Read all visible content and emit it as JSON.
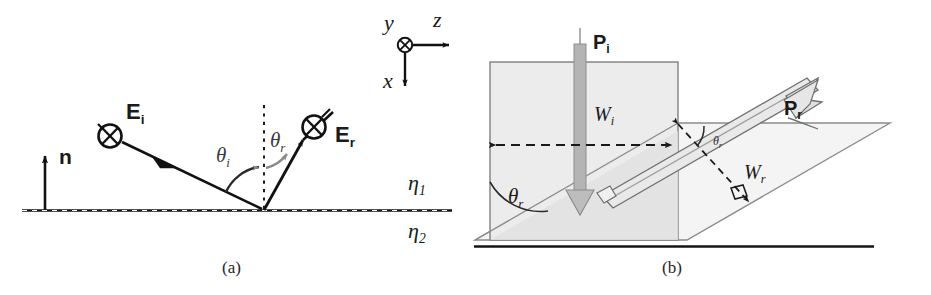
{
  "figure": {
    "width": 931,
    "height": 295,
    "background": "#ffffff"
  },
  "colors": {
    "line": "#111111",
    "beam_fill": "#ececec",
    "beam_fill_dark": "#dddddd",
    "beam_outline": "#8c8c8c",
    "arrow_gray": "#a8a8a8",
    "interface_dash": "#2a2a2a",
    "text": "#1a1a1a"
  },
  "panel_a": {
    "caption": "(a)",
    "axes": {
      "y_label": "y",
      "z_label": "z",
      "x_label": "x",
      "origin_marker": "circle-x-marker"
    },
    "normal": {
      "label": "n",
      "description": "surface normal unit vector"
    },
    "incident": {
      "field_label": "E",
      "field_sub": "i",
      "angle_label": "θ",
      "angle_sub": "i",
      "polarization_marker": "circle-x-marker"
    },
    "reflected": {
      "field_label": "E",
      "field_sub": "r",
      "angle_label": "θ",
      "angle_sub": "r",
      "polarization_marker": "circle-x-marker"
    },
    "media": {
      "upper_label": "η",
      "upper_sub": "1",
      "lower_label": "η",
      "lower_sub": "2"
    }
  },
  "panel_b": {
    "caption": "(b)",
    "incident_beam": {
      "power_label": "P",
      "power_sub": "i",
      "width_label": "W",
      "width_sub": "i"
    },
    "reflected_beam": {
      "power_label": "P",
      "power_sub": "r",
      "width_label": "W",
      "width_sub": "r"
    },
    "angles": {
      "ground_angle_label": "θ",
      "ground_angle_sub": "r",
      "beam_angle_label": "θ",
      "beam_angle_sub": "r"
    },
    "right_angle_marker": "right-angle-square"
  }
}
